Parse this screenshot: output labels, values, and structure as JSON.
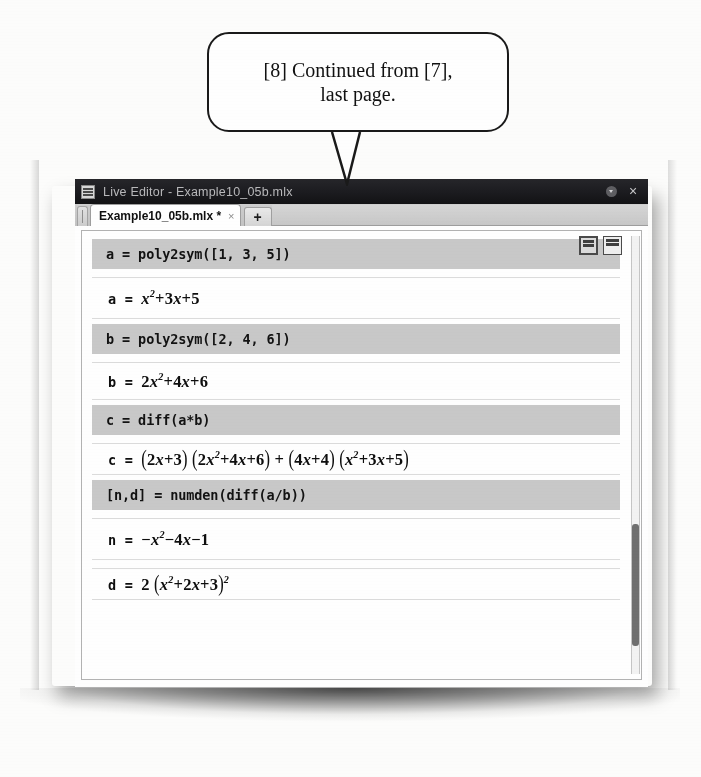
{
  "callout": {
    "text": "[8] Continued from [7],\nlast page."
  },
  "window": {
    "title": "Live Editor - Example10_05b.mlx",
    "icon": "matlab-app-icon",
    "dropdown_label": "▾",
    "close_label": "×"
  },
  "tabs": {
    "active": "Example10_05b.mlx *",
    "close_label": "×",
    "new_tab_label": "+"
  },
  "toolbar": {
    "buttons": [
      {
        "name": "save-icon"
      },
      {
        "name": "layout-icon"
      }
    ]
  },
  "document": {
    "rows": [
      {
        "kind": "code",
        "text": "a = poly2sym([1, 3, 5])"
      },
      {
        "kind": "output",
        "label": "a = ",
        "expr_html": "<span class=\"it\">x</span><sup>2</sup>+3<span class=\"it\">x</span>+5"
      },
      {
        "kind": "code",
        "text": "b = poly2sym([2, 4, 6])"
      },
      {
        "kind": "output",
        "label": "b = ",
        "expr_html": "2<span class=\"it\">x</span><sup>2</sup>+4<span class=\"it\">x</span>+6"
      },
      {
        "kind": "code",
        "text": "c = diff(a*b)"
      },
      {
        "kind": "output",
        "label": "c = ",
        "expr_html": "<span class=\"paren\">(</span>2<span class=\"it\">x</span>+3<span class=\"paren\">)</span> <span class=\"paren\">(</span>2<span class=\"it\">x</span><sup>2</sup>+4<span class=\"it\">x</span>+6<span class=\"paren\">)</span> + <span class=\"paren\">(</span>4<span class=\"it\">x</span>+4<span class=\"paren\">)</span> <span class=\"paren\">(</span><span class=\"it\">x</span><sup>2</sup>+3<span class=\"it\">x</span>+5<span class=\"paren\">)</span>"
      },
      {
        "kind": "code",
        "text": "[n,d] = numden(diff(a/b))"
      },
      {
        "kind": "output",
        "label": "n = ",
        "expr_html": "−<span class=\"it\">x</span><sup>2</sup>−4<span class=\"it\">x</span>−1"
      },
      {
        "kind": "output",
        "label": "d = ",
        "expr_html": "2 <span class=\"paren\">(</span><span class=\"it\">x</span><sup>2</sup>+2<span class=\"it\">x</span>+3<span class=\"paren\">)</span><sup>2</sup>"
      }
    ]
  },
  "scrollbar": {
    "orientation": "vertical",
    "thumb_position": "near-bottom"
  },
  "colors": {
    "code_band": "#c9c9c9",
    "titlebar": "#1b1b1f",
    "page": "#fdfdfc"
  }
}
